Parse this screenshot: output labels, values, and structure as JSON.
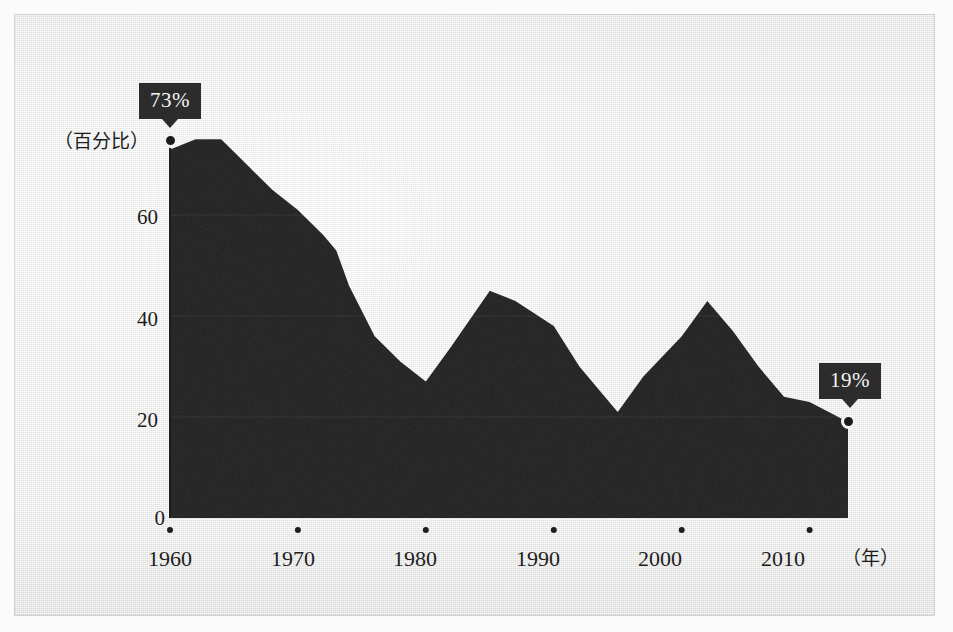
{
  "figure": {
    "background_color": "#ececeb",
    "area_color": "#2a2a2a",
    "axis_color": "#1d1d1d",
    "tooltip_color": "#2c2c2c"
  },
  "annotations": {
    "start_label": "73%",
    "end_label": "19%",
    "y_axis_caption": "（百分比）",
    "x_axis_caption": "（年）"
  },
  "chart_data": {
    "type": "area",
    "title": "",
    "xlabel": "（年）",
    "ylabel": "（百分比）",
    "xlim": [
      1960,
      2013
    ],
    "ylim": [
      0,
      77
    ],
    "grid": true,
    "legend": "none",
    "yticks": [
      "0",
      "20",
      "40",
      "60"
    ],
    "ytick_values": [
      0,
      20,
      40,
      60
    ],
    "xticks": [
      "1960",
      "1970",
      "1980",
      "1990",
      "2000",
      "2010"
    ],
    "xtick_values": [
      1960,
      1970,
      1980,
      1990,
      2000,
      2010
    ],
    "series": [
      {
        "name": "percentage",
        "x": [
          1960,
          1962,
          1964,
          1966,
          1968,
          1970,
          1972,
          1973,
          1974,
          1976,
          1978,
          1980,
          1982,
          1985,
          1987,
          1990,
          1992,
          1995,
          1997,
          2000,
          2002,
          2004,
          2006,
          2008,
          2010,
          2013
        ],
        "values": [
          73,
          75,
          75,
          70,
          65,
          61,
          56,
          53,
          46,
          36,
          31,
          27,
          34,
          45,
          43,
          38,
          30,
          21,
          28,
          36,
          43,
          37,
          30,
          24,
          23,
          19
        ]
      }
    ],
    "data_labels": [
      {
        "x": 1960,
        "y": 73,
        "text": "73%"
      },
      {
        "x": 2013,
        "y": 19,
        "text": "19%"
      }
    ]
  }
}
